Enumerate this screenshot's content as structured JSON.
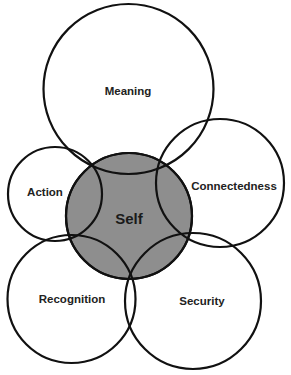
{
  "diagram": {
    "type": "overlapping-circles",
    "center": {
      "label": "Self",
      "fill": "#8e8e8e"
    },
    "outer": [
      {
        "id": "meaning",
        "label": "Meaning"
      },
      {
        "id": "action",
        "label": "Action"
      },
      {
        "id": "connectedness",
        "label": "Connectedness"
      },
      {
        "id": "recognition",
        "label": "Recognition"
      },
      {
        "id": "security",
        "label": "Security"
      }
    ],
    "stroke_color": "#111111",
    "background": "#ffffff"
  }
}
